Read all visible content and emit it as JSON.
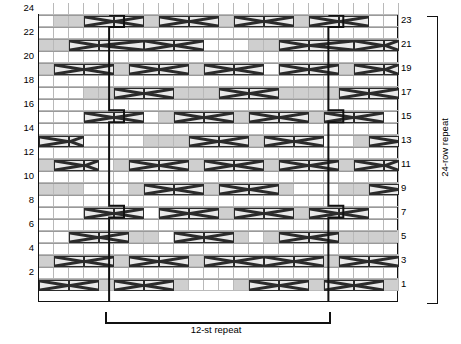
{
  "chart_data": {
    "type": "table",
    "grid": {
      "columns": 24,
      "rows": 24
    },
    "row_labels_left": [
      "24",
      "22",
      "20",
      "18",
      "16",
      "14",
      "12",
      "10",
      "8",
      "6",
      "4",
      "2"
    ],
    "row_labels_right": [
      "23",
      "21",
      "19",
      "17",
      "15",
      "13",
      "11",
      "9",
      "7",
      "5",
      "3",
      "1"
    ],
    "annotations": {
      "stitch_repeat": "12-st repeat",
      "row_repeat": "24-row repeat"
    },
    "legend_colors": {
      "shaded_cell": "#cfcfcf",
      "light_shaded_cell": "#dcdcdc",
      "symbol_fill": "#e9e9e9",
      "grid_line": "#b9b9b9",
      "border": "#111111"
    },
    "repeat_box": {
      "left_column": 4.7,
      "right_column": 19.4,
      "jog_rows": [
        23,
        15,
        7
      ],
      "jog_width": 1
    },
    "shaded_runs": [
      {
        "row": 23,
        "cols": [
          [
            1,
            9
          ],
          [
            10,
            17
          ],
          [
            18,
            21
          ]
        ]
      },
      {
        "row": 21,
        "cols": [
          [
            0,
            1
          ],
          [
            2,
            8
          ],
          [
            14,
            16
          ],
          [
            17,
            21
          ],
          [
            22,
            23
          ]
        ]
      },
      {
        "row": 19,
        "cols": [
          [
            0,
            0
          ],
          [
            1,
            6
          ],
          [
            7,
            11
          ],
          [
            16,
            19
          ],
          [
            20,
            23
          ]
        ]
      },
      {
        "row": 17,
        "cols": [
          [
            3,
            7
          ],
          [
            9,
            12
          ],
          [
            13,
            15
          ],
          [
            16,
            19
          ],
          [
            20,
            22
          ]
        ]
      },
      {
        "row": 15,
        "cols": [
          [
            4,
            5
          ],
          [
            8,
            13
          ],
          [
            14,
            19
          ],
          [
            20,
            21
          ]
        ]
      },
      {
        "row": 13,
        "cols": [
          [
            0,
            2
          ],
          [
            7,
            12
          ],
          [
            13,
            17
          ],
          [
            21,
            23
          ]
        ]
      },
      {
        "row": 11,
        "cols": [
          [
            0,
            3
          ],
          [
            5,
            10
          ],
          [
            11,
            16
          ],
          [
            19,
            23
          ]
        ]
      },
      {
        "row": 9,
        "cols": [
          [
            0,
            2
          ],
          [
            6,
            11
          ],
          [
            12,
            16
          ],
          [
            20,
            23
          ]
        ]
      },
      {
        "row": 7,
        "cols": [
          [
            4,
            5
          ],
          [
            8,
            12
          ],
          [
            13,
            18
          ],
          [
            19,
            21
          ]
        ]
      },
      {
        "row": 5,
        "cols": [
          [
            2,
            7
          ],
          [
            9,
            13
          ],
          [
            15,
            20
          ],
          [
            21,
            23
          ]
        ]
      },
      {
        "row": 3,
        "cols": [
          [
            0,
            1
          ],
          [
            2,
            7
          ],
          [
            9,
            12
          ],
          [
            15,
            20
          ],
          [
            21,
            23
          ]
        ]
      },
      {
        "row": 1,
        "cols": [
          [
            0,
            5
          ],
          [
            6,
            9
          ],
          [
            13,
            18
          ],
          [
            19,
            23
          ]
        ]
      }
    ],
    "cables": [
      {
        "row": 23,
        "col": 3,
        "span": 2,
        "dir": "left"
      },
      {
        "row": 23,
        "col": 5,
        "span": 2,
        "dir": "right"
      },
      {
        "row": 23,
        "col": 8,
        "span": 2,
        "dir": "left"
      },
      {
        "row": 23,
        "col": 10,
        "span": 2,
        "dir": "right"
      },
      {
        "row": 23,
        "col": 13,
        "span": 2,
        "dir": "left"
      },
      {
        "row": 23,
        "col": 15,
        "span": 2,
        "dir": "right"
      },
      {
        "row": 23,
        "col": 18,
        "span": 2,
        "dir": "left"
      },
      {
        "row": 23,
        "col": 20,
        "span": 2,
        "dir": "right"
      },
      {
        "row": 21,
        "col": 2,
        "span": 2,
        "dir": "left"
      },
      {
        "row": 21,
        "col": 4,
        "span": 3,
        "dir": "right"
      },
      {
        "row": 21,
        "col": 7,
        "span": 2,
        "dir": "left"
      },
      {
        "row": 21,
        "col": 9,
        "span": 2,
        "dir": "right"
      },
      {
        "row": 21,
        "col": 16,
        "span": 2,
        "dir": "left"
      },
      {
        "row": 21,
        "col": 18,
        "span": 3,
        "dir": "right"
      },
      {
        "row": 21,
        "col": 21,
        "span": 2,
        "dir": "left"
      },
      {
        "row": 21,
        "col": 23,
        "span": 1,
        "dir": "right"
      },
      {
        "row": 19,
        "col": 1,
        "span": 2,
        "dir": "left"
      },
      {
        "row": 19,
        "col": 3,
        "span": 2,
        "dir": "right"
      },
      {
        "row": 19,
        "col": 6,
        "span": 2,
        "dir": "left"
      },
      {
        "row": 19,
        "col": 8,
        "span": 2,
        "dir": "right"
      },
      {
        "row": 19,
        "col": 11,
        "span": 2,
        "dir": "left"
      },
      {
        "row": 19,
        "col": 13,
        "span": 2,
        "dir": "right"
      },
      {
        "row": 19,
        "col": 16,
        "span": 2,
        "dir": "left"
      },
      {
        "row": 19,
        "col": 18,
        "span": 2,
        "dir": "right"
      },
      {
        "row": 19,
        "col": 21,
        "span": 2,
        "dir": "left"
      },
      {
        "row": 19,
        "col": 23,
        "span": 1,
        "dir": "right"
      },
      {
        "row": 17,
        "col": 5,
        "span": 2,
        "dir": "left"
      },
      {
        "row": 17,
        "col": 7,
        "span": 2,
        "dir": "right"
      },
      {
        "row": 17,
        "col": 12,
        "span": 2,
        "dir": "left"
      },
      {
        "row": 17,
        "col": 14,
        "span": 2,
        "dir": "right"
      },
      {
        "row": 17,
        "col": 20,
        "span": 2,
        "dir": "left"
      },
      {
        "row": 17,
        "col": 22,
        "span": 2,
        "dir": "right"
      },
      {
        "row": 15,
        "col": 3,
        "span": 2,
        "dir": "left"
      },
      {
        "row": 15,
        "col": 5,
        "span": 2,
        "dir": "right"
      },
      {
        "row": 15,
        "col": 9,
        "span": 2,
        "dir": "left"
      },
      {
        "row": 15,
        "col": 11,
        "span": 2,
        "dir": "right"
      },
      {
        "row": 15,
        "col": 14,
        "span": 2,
        "dir": "left"
      },
      {
        "row": 15,
        "col": 16,
        "span": 2,
        "dir": "right"
      },
      {
        "row": 15,
        "col": 19,
        "span": 2,
        "dir": "left"
      },
      {
        "row": 15,
        "col": 21,
        "span": 2,
        "dir": "right"
      },
      {
        "row": 13,
        "col": 0,
        "span": 2,
        "dir": "left"
      },
      {
        "row": 13,
        "col": 2,
        "span": 1,
        "dir": "right"
      },
      {
        "row": 13,
        "col": 10,
        "span": 2,
        "dir": "left"
      },
      {
        "row": 13,
        "col": 12,
        "span": 2,
        "dir": "right"
      },
      {
        "row": 13,
        "col": 15,
        "span": 2,
        "dir": "left"
      },
      {
        "row": 13,
        "col": 17,
        "span": 2,
        "dir": "right"
      },
      {
        "row": 13,
        "col": 22,
        "span": 2,
        "dir": "left"
      },
      {
        "row": 11,
        "col": 1,
        "span": 2,
        "dir": "left"
      },
      {
        "row": 11,
        "col": 3,
        "span": 1,
        "dir": "right"
      },
      {
        "row": 11,
        "col": 6,
        "span": 2,
        "dir": "left"
      },
      {
        "row": 11,
        "col": 8,
        "span": 2,
        "dir": "right"
      },
      {
        "row": 11,
        "col": 11,
        "span": 2,
        "dir": "left"
      },
      {
        "row": 11,
        "col": 13,
        "span": 2,
        "dir": "right"
      },
      {
        "row": 11,
        "col": 16,
        "span": 2,
        "dir": "left"
      },
      {
        "row": 11,
        "col": 18,
        "span": 2,
        "dir": "right"
      },
      {
        "row": 11,
        "col": 21,
        "span": 2,
        "dir": "left"
      },
      {
        "row": 11,
        "col": 23,
        "span": 1,
        "dir": "right"
      },
      {
        "row": 9,
        "col": 7,
        "span": 2,
        "dir": "left"
      },
      {
        "row": 9,
        "col": 9,
        "span": 2,
        "dir": "right"
      },
      {
        "row": 9,
        "col": 12,
        "span": 2,
        "dir": "left"
      },
      {
        "row": 9,
        "col": 14,
        "span": 2,
        "dir": "right"
      },
      {
        "row": 9,
        "col": 22,
        "span": 2,
        "dir": "left"
      },
      {
        "row": 7,
        "col": 3,
        "span": 2,
        "dir": "left"
      },
      {
        "row": 7,
        "col": 5,
        "span": 2,
        "dir": "right"
      },
      {
        "row": 7,
        "col": 8,
        "span": 2,
        "dir": "left"
      },
      {
        "row": 7,
        "col": 10,
        "span": 2,
        "dir": "right"
      },
      {
        "row": 7,
        "col": 13,
        "span": 2,
        "dir": "left"
      },
      {
        "row": 7,
        "col": 15,
        "span": 2,
        "dir": "right"
      },
      {
        "row": 7,
        "col": 18,
        "span": 2,
        "dir": "left"
      },
      {
        "row": 7,
        "col": 20,
        "span": 2,
        "dir": "right"
      },
      {
        "row": 5,
        "col": 2,
        "span": 2,
        "dir": "left"
      },
      {
        "row": 5,
        "col": 4,
        "span": 2,
        "dir": "right"
      },
      {
        "row": 5,
        "col": 9,
        "span": 2,
        "dir": "left"
      },
      {
        "row": 5,
        "col": 11,
        "span": 2,
        "dir": "right"
      },
      {
        "row": 5,
        "col": 16,
        "span": 2,
        "dir": "left"
      },
      {
        "row": 5,
        "col": 18,
        "span": 2,
        "dir": "right"
      },
      {
        "row": 3,
        "col": 1,
        "span": 2,
        "dir": "left"
      },
      {
        "row": 3,
        "col": 3,
        "span": 2,
        "dir": "right"
      },
      {
        "row": 3,
        "col": 6,
        "span": 2,
        "dir": "left"
      },
      {
        "row": 3,
        "col": 8,
        "span": 2,
        "dir": "right"
      },
      {
        "row": 3,
        "col": 11,
        "span": 2,
        "dir": "left"
      },
      {
        "row": 3,
        "col": 13,
        "span": 2,
        "dir": "right"
      },
      {
        "row": 3,
        "col": 15,
        "span": 2,
        "dir": "left"
      },
      {
        "row": 3,
        "col": 17,
        "span": 2,
        "dir": "right"
      },
      {
        "row": 3,
        "col": 20,
        "span": 2,
        "dir": "left"
      },
      {
        "row": 3,
        "col": 22,
        "span": 2,
        "dir": "right"
      },
      {
        "row": 1,
        "col": 0,
        "span": 2,
        "dir": "left"
      },
      {
        "row": 1,
        "col": 2,
        "span": 2,
        "dir": "right"
      },
      {
        "row": 1,
        "col": 5,
        "span": 2,
        "dir": "left"
      },
      {
        "row": 1,
        "col": 7,
        "span": 2,
        "dir": "right"
      },
      {
        "row": 1,
        "col": 14,
        "span": 2,
        "dir": "left"
      },
      {
        "row": 1,
        "col": 16,
        "span": 2,
        "dir": "right"
      },
      {
        "row": 1,
        "col": 19,
        "span": 2,
        "dir": "left"
      },
      {
        "row": 1,
        "col": 21,
        "span": 2,
        "dir": "right"
      }
    ]
  }
}
